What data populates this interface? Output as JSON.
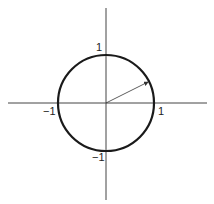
{
  "diagram": {
    "type": "unit-circle",
    "labels": {
      "top": "1",
      "bottom": "−1",
      "left": "−1",
      "right": "1"
    },
    "colors": {
      "axis": "#444444",
      "circle": "#1a1a1a",
      "arrow": "#333333",
      "text": "#222222"
    }
  }
}
